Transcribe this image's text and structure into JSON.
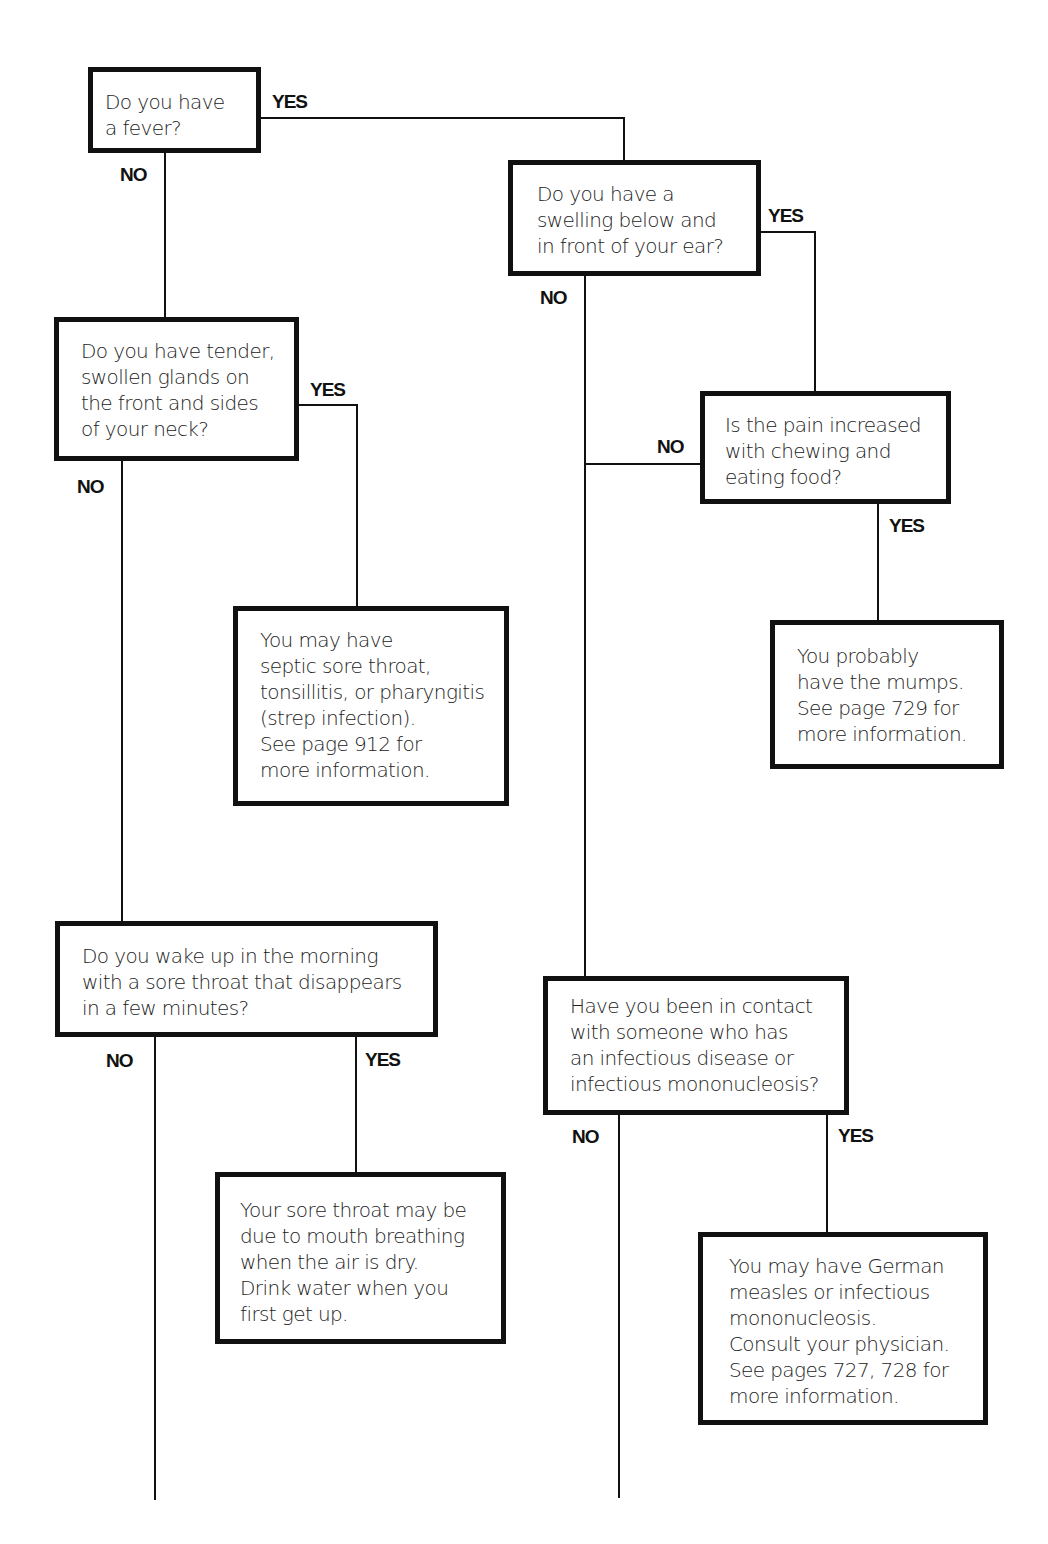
{
  "flowchart": {
    "nodes": {
      "q_fever": {
        "type": "question",
        "text": "Do you have\na fever?"
      },
      "q_swelling": {
        "type": "question",
        "text": "Do you have a\nswelling below and\nin front of your ear?"
      },
      "q_glands": {
        "type": "question",
        "text": "Do you have tender,\nswollen glands on\nthe front and sides\nof your neck?"
      },
      "q_chewing": {
        "type": "question",
        "text": "Is the pain increased\nwith chewing and\neating food?"
      },
      "r_strep": {
        "type": "result",
        "text": "You may have\nseptic sore throat,\ntonsillitis, or pharyngitis\n(strep infection).\nSee page 912 for\nmore information."
      },
      "r_mumps": {
        "type": "result",
        "text": "You probably\nhave the mumps.\nSee page 729 for\nmore information."
      },
      "q_morning": {
        "type": "question",
        "text": "Do you wake up in the morning\nwith a sore throat that disappears\nin a few minutes?"
      },
      "q_contact": {
        "type": "question",
        "text": "Have you been in contact\nwith someone who has\nan infectious disease or\ninfectious mononucleosis?"
      },
      "r_mouth_breathing": {
        "type": "result",
        "text": "Your sore throat may be\ndue to mouth breathing\nwhen the air is dry.\nDrink water when you\nfirst get up."
      },
      "r_measles_mono": {
        "type": "result",
        "text": "You may have German\nmeasles or infectious\nmononucleosis.\nConsult your physician.\nSee pages 727, 728 for\nmore information."
      }
    },
    "edges": [
      {
        "from": "q_fever",
        "to": "q_swelling",
        "label": "YES"
      },
      {
        "from": "q_fever",
        "to": "q_glands",
        "label": "NO"
      },
      {
        "from": "q_swelling",
        "to": "q_chewing",
        "label": "YES"
      },
      {
        "from": "q_swelling",
        "to": "q_contact",
        "label": "NO"
      },
      {
        "from": "q_chewing",
        "to": "q_contact",
        "label": "NO"
      },
      {
        "from": "q_chewing",
        "to": "r_mumps",
        "label": "YES"
      },
      {
        "from": "q_glands",
        "to": "r_strep",
        "label": "YES"
      },
      {
        "from": "q_glands",
        "to": "q_morning",
        "label": "NO"
      },
      {
        "from": "q_morning",
        "to": "r_mouth_breathing",
        "label": "YES"
      },
      {
        "from": "q_morning",
        "to": "continues-below",
        "label": "NO"
      },
      {
        "from": "q_contact",
        "to": "r_measles_mono",
        "label": "YES"
      },
      {
        "from": "q_contact",
        "to": "continues-below",
        "label": "NO"
      }
    ],
    "labels": {
      "yes": "YES",
      "no": "NO"
    },
    "colors": {
      "line": "#111111",
      "box_border": "#111111",
      "background": "#ffffff"
    }
  }
}
